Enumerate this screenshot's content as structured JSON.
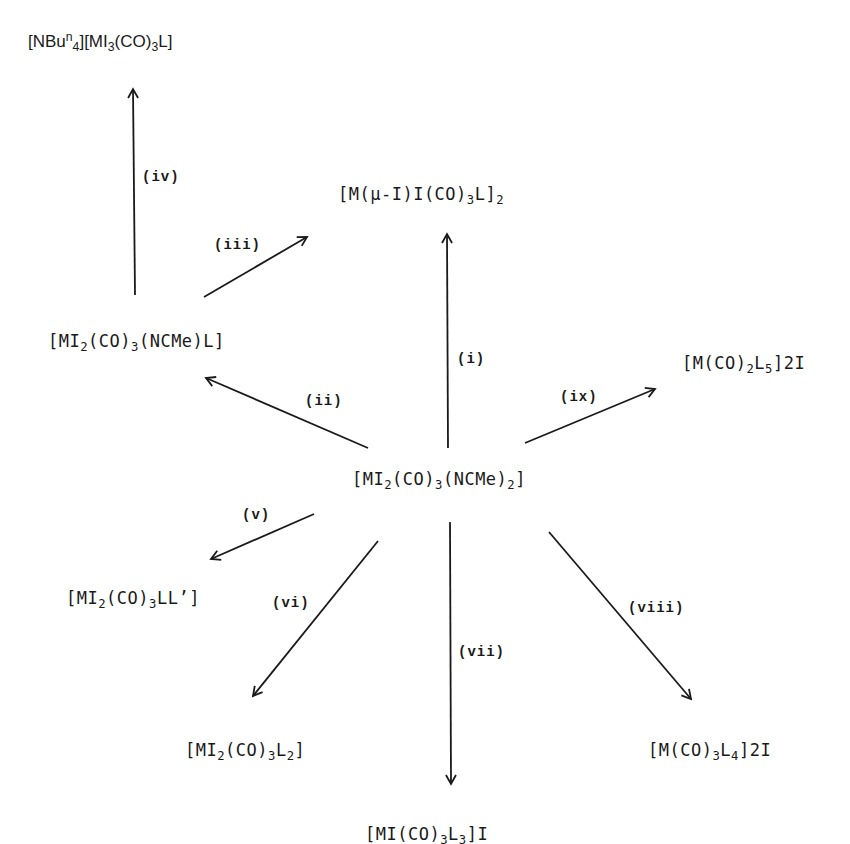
{
  "diagram": {
    "center": {
      "id": "start",
      "parts": [
        "[MI",
        "2",
        "(CO)",
        "3",
        "(NCMe)",
        "2",
        "]"
      ],
      "text": "[MI2(CO)3(NCMe)2]"
    },
    "compounds": {
      "nbu4_salt": {
        "parts": [
          "[NBu",
          "n",
          "4",
          "][MI",
          "3",
          "(CO)",
          "3",
          "L]"
        ],
        "text": "[NBun4][MI3(CO)3L]"
      },
      "dimer": {
        "parts": [
          "[M(μ-I)I(CO)",
          "3",
          "L]",
          "2"
        ],
        "text": "[M(μ-I)I(CO)3L]2"
      },
      "mono_nitrile": {
        "parts": [
          "[MI",
          "2",
          "(CO)",
          "3",
          "(NCMe)L]"
        ],
        "text": "[MI2(CO)3(NCMe)L]"
      },
      "dicarbonyl_L5": {
        "parts": [
          "[M(CO)",
          "2",
          "L",
          "5",
          "]2I"
        ],
        "text": "[M(CO)2L5]2I"
      },
      "mixed_LLprime": {
        "parts": [
          "[MI",
          "2",
          "(CO)",
          "3",
          "LL’]"
        ],
        "text": "[MI2(CO)3LL']"
      },
      "bis_L": {
        "parts": [
          "[MI",
          "2",
          "(CO)",
          "3",
          "L",
          "2",
          "]"
        ],
        "text": "[MI2(CO)3L2]"
      },
      "tris_L": {
        "parts": [
          "[MI(CO)",
          "3",
          "L",
          "3",
          "]I"
        ],
        "text": "[MI(CO)3L3]I"
      },
      "tetra_L": {
        "parts": [
          "[M(CO)",
          "3",
          "L",
          "4",
          "]2I"
        ],
        "text": "[M(CO)3L4]2I"
      }
    },
    "steps": [
      {
        "label": "(i)",
        "from": "start",
        "to": "dimer"
      },
      {
        "label": "(ii)",
        "from": "start",
        "to": "mono_nitrile"
      },
      {
        "label": "(iii)",
        "from": "mono_nitrile",
        "to": "dimer"
      },
      {
        "label": "(iv)",
        "from": "mono_nitrile",
        "to": "nbu4_salt"
      },
      {
        "label": "(v)",
        "from": "start",
        "to": "mixed_LLprime"
      },
      {
        "label": "(vi)",
        "from": "start",
        "to": "bis_L"
      },
      {
        "label": "(vii)",
        "from": "start",
        "to": "tris_L"
      },
      {
        "label": "(viii)",
        "from": "start",
        "to": "tetra_L"
      },
      {
        "label": "(ix)",
        "from": "start",
        "to": "dicarbonyl_L5"
      }
    ],
    "colors": {
      "ink": "#1a1a1a",
      "background": "#ffffff"
    }
  }
}
